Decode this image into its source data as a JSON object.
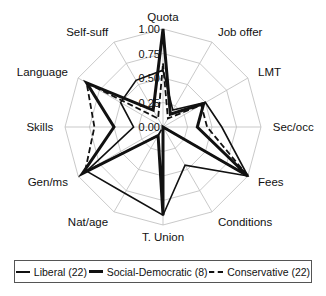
{
  "chart_data": {
    "type": "radar",
    "title": "",
    "axes": [
      "Quota",
      "Job offer",
      "LMT",
      "Sec/occ",
      "Fees",
      "Conditions",
      "T. Union",
      "Nat/age",
      "Gen/ms",
      "Skills",
      "Language",
      "Self-suff"
    ],
    "ticks": [
      "0.00",
      "0.25",
      "0.50",
      "0.75",
      "1.00"
    ],
    "rlim": [
      0,
      1
    ],
    "grid": true,
    "legend_position": "bottom",
    "series": [
      {
        "name": "Liberal (22)",
        "style": "thin",
        "values": [
          0.58,
          0.2,
          0.5,
          0.6,
          1.0,
          0.45,
          0.9,
          0.78,
          0.9,
          0.3,
          0.5,
          0.55
        ]
      },
      {
        "name": "Social-Democratic (8)",
        "style": "thick",
        "values": [
          1.0,
          0.15,
          0.48,
          0.35,
          1.0,
          0.0,
          0.9,
          0.1,
          0.95,
          0.5,
          0.9,
          0.2
        ]
      },
      {
        "name": "Conservative (22)",
        "style": "dashed",
        "values": [
          0.65,
          0.1,
          0.45,
          0.45,
          1.0,
          0.0,
          0.0,
          0.1,
          0.92,
          0.7,
          0.9,
          0.1
        ]
      }
    ]
  },
  "legend": {
    "items": [
      {
        "label": "Liberal (22)"
      },
      {
        "label": "Social-Democratic (8)"
      },
      {
        "label": "Conservative (22)"
      }
    ]
  }
}
